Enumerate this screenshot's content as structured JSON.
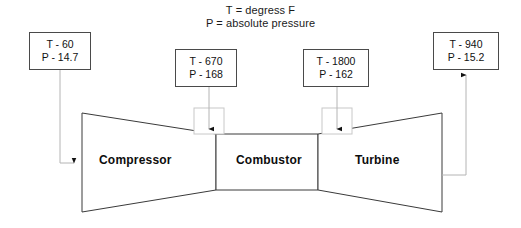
{
  "figure": {
    "legend": {
      "temperature_note": "T = degress F",
      "pressure_note": "P = absolute pressure"
    },
    "stations": [
      {
        "id": "inlet",
        "name": "compressor-inlet",
        "temperature_label": "T - 60",
        "pressure_label": "P - 14.7"
      },
      {
        "id": "compressor_exit",
        "name": "compressor-exit",
        "temperature_label": "T - 670",
        "pressure_label": "P - 168"
      },
      {
        "id": "combustor_exit",
        "name": "combustor-exit",
        "temperature_label": "T - 1800",
        "pressure_label": "P - 162"
      },
      {
        "id": "turbine_exit",
        "name": "turbine-exit",
        "temperature_label": "T - 940",
        "pressure_label": "P - 15.2"
      }
    ],
    "components": {
      "compressor": "Compressor",
      "combustor": "Combustor",
      "turbine": "Turbine"
    },
    "icons": {
      "inlet_flow_arrow": "arrow-right-icon",
      "compressor_station_arrow": "arrow-down-icon",
      "combustor_station_arrow": "arrow-down-icon",
      "exhaust_station_arrow": "arrow-up-icon"
    },
    "colors": {
      "outline": "#3a3a3a",
      "leader": "#9a9a9a",
      "text": "#111111",
      "background": "#ffffff"
    }
  }
}
